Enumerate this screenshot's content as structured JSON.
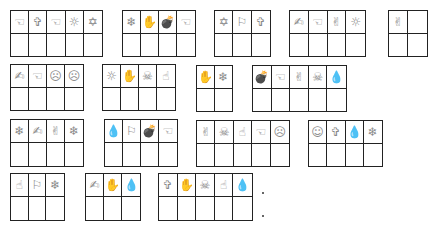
{
  "icon_map": {
    "pointing-hand": "☜",
    "cross": "✞",
    "sun": "☼",
    "star-of-david": "✡",
    "snowflake": "❄",
    "open-hand": "✋",
    "bomb": "💣",
    "flag": "⚐",
    "victory-hand": "✌",
    "index-finger": "☝",
    "frown-face": "☹",
    "smile-face": "☺",
    "skull-crossbones": "☠",
    "drop": "💧",
    "writing-hand": "✍"
  },
  "boxes": [
    {
      "x": 10,
      "y": 10,
      "w": 93,
      "h": 47,
      "icons": [
        "pointing-hand",
        "cross",
        "pointing-hand",
        "sun",
        "star-of-david"
      ]
    },
    {
      "x": 122,
      "y": 10,
      "w": 74,
      "h": 47,
      "icons": [
        "snowflake",
        "open-hand",
        "bomb",
        "pointing-hand"
      ]
    },
    {
      "x": 214,
      "y": 10,
      "w": 57,
      "h": 47,
      "icons": [
        "star-of-david",
        "flag",
        "cross"
      ]
    },
    {
      "x": 289,
      "y": 10,
      "w": 77,
      "h": 47,
      "icons": [
        "writing-hand",
        "pointing-hand",
        "victory-hand",
        "sun"
      ]
    },
    {
      "x": 388,
      "y": 10,
      "w": 40,
      "h": 47,
      "icons": [
        "victory-hand",
        ""
      ]
    },
    {
      "x": 10,
      "y": 64,
      "w": 74,
      "h": 47,
      "icons": [
        "writing-hand",
        "pointing-hand",
        "frown-face",
        "frown-face"
      ]
    },
    {
      "x": 102,
      "y": 64,
      "w": 74,
      "h": 47,
      "icons": [
        "sun",
        "open-hand",
        "skull-crossbones",
        "index-finger"
      ]
    },
    {
      "x": 196,
      "y": 65,
      "w": 37,
      "h": 47,
      "icons": [
        "open-hand",
        "snowflake"
      ]
    },
    {
      "x": 252,
      "y": 65,
      "w": 95,
      "h": 47,
      "icons": [
        "bomb",
        "pointing-hand",
        "victory-hand",
        "skull-crossbones",
        "drop"
      ]
    },
    {
      "x": 10,
      "y": 119,
      "w": 74,
      "h": 48,
      "icons": [
        "snowflake",
        "writing-hand",
        "victory-hand",
        "snowflake"
      ]
    },
    {
      "x": 104,
      "y": 119,
      "w": 74,
      "h": 48,
      "icons": [
        "drop",
        "flag",
        "bomb",
        "pointing-hand"
      ]
    },
    {
      "x": 196,
      "y": 120,
      "w": 94,
      "h": 47,
      "icons": [
        "victory-hand",
        "skull-crossbones",
        "index-finger",
        "pointing-hand",
        "frown-face"
      ]
    },
    {
      "x": 308,
      "y": 120,
      "w": 75,
      "h": 47,
      "icons": [
        "smile-face",
        "cross",
        "drop",
        "snowflake"
      ]
    },
    {
      "x": 10,
      "y": 173,
      "w": 55,
      "h": 48,
      "icons": [
        "index-finger",
        "flag",
        "snowflake"
      ]
    },
    {
      "x": 85,
      "y": 173,
      "w": 56,
      "h": 48,
      "icons": [
        "writing-hand",
        "open-hand",
        "drop"
      ]
    },
    {
      "x": 158,
      "y": 173,
      "w": 95,
      "h": 48,
      "icons": [
        "cross",
        "open-hand",
        "skull-crossbones",
        "index-finger",
        "drop"
      ]
    }
  ],
  "dots": [
    {
      "x": 262,
      "y": 192
    },
    {
      "x": 262,
      "y": 215
    }
  ]
}
